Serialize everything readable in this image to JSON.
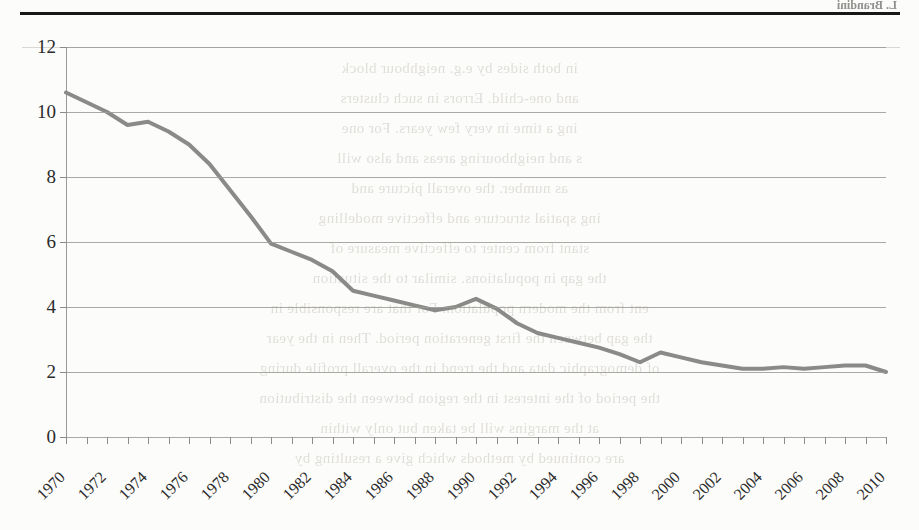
{
  "page": {
    "header_text": "L. Brandini",
    "bleed_lines": [
      "in both sides by e.g. neighbour block",
      "and one-child. Errors in such clusters",
      "ing a time in very few years. For one",
      "s and neighbouring areas and also will",
      "as number. the overall picture and",
      "ing spatial structure and effective modelling",
      "stant from center to effective measure of",
      "the gap in populations. similar to the situation",
      "ent from the modern population. For that are responsible in",
      "the gap between the first generation period. Then in the year",
      "of demographic data and the trend in the overall profile during",
      "the period of the interest in the region between the distribution",
      "at the margins will be taken but only within",
      "are continued by methods which give a resulting by"
    ]
  },
  "chart_data": {
    "type": "line",
    "title": "",
    "xlabel": "",
    "ylabel": "",
    "ylim": [
      0,
      12
    ],
    "yticks": [
      0,
      2,
      4,
      6,
      8,
      10,
      12
    ],
    "grid": true,
    "legend": "none",
    "line_color": "#8a8a88",
    "xlim": [
      1970,
      2010
    ],
    "x_tick_step": 1,
    "x_label_step": 2,
    "tick_labels": [
      "1970",
      "1972",
      "1974",
      "1976",
      "1978",
      "1980",
      "1982",
      "1984",
      "1986",
      "1988",
      "1990",
      "1992",
      "1994",
      "1996",
      "1998",
      "2000",
      "2002",
      "2004",
      "2006",
      "2008",
      "2010"
    ],
    "x": [
      1970,
      1971,
      1972,
      1973,
      1974,
      1975,
      1976,
      1977,
      1978,
      1979,
      1980,
      1981,
      1982,
      1983,
      1984,
      1985,
      1986,
      1987,
      1988,
      1989,
      1990,
      1991,
      1992,
      1993,
      1994,
      1995,
      1996,
      1997,
      1998,
      1999,
      2000,
      2001,
      2002,
      2003,
      2004,
      2005,
      2006,
      2007,
      2008,
      2009,
      2010
    ],
    "values": [
      10.6,
      10.3,
      10.0,
      9.6,
      9.7,
      9.4,
      9.0,
      8.4,
      7.6,
      6.8,
      5.95,
      5.7,
      5.45,
      5.1,
      4.5,
      4.35,
      4.2,
      4.05,
      3.9,
      4.0,
      4.25,
      3.95,
      3.5,
      3.2,
      3.05,
      2.9,
      2.75,
      2.55,
      2.3,
      2.6,
      2.45,
      2.3,
      2.2,
      2.1,
      2.1,
      2.15,
      2.1,
      2.15,
      2.2,
      2.2,
      2.0
    ]
  }
}
